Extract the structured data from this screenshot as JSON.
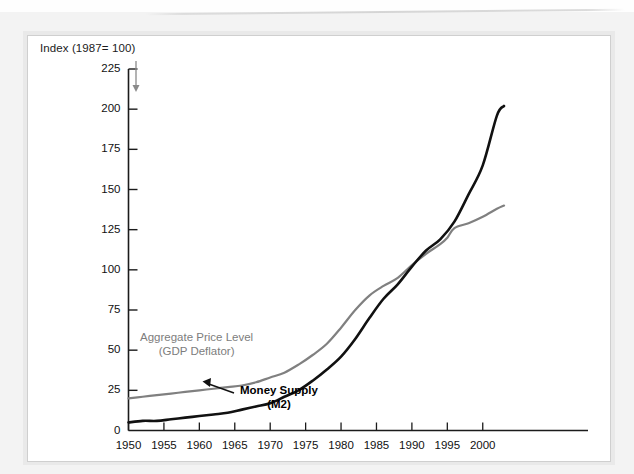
{
  "chart_data": {
    "type": "line",
    "title": "",
    "ylabel": "Index (1987= 100)",
    "xlabel": "",
    "xlim": [
      1950,
      2003
    ],
    "ylim": [
      0,
      225
    ],
    "yticks": [
      0,
      25,
      50,
      75,
      100,
      125,
      150,
      175,
      200,
      225
    ],
    "xticks": [
      1950,
      1955,
      1960,
      1965,
      1970,
      1975,
      1980,
      1985,
      1990,
      1995,
      2000
    ],
    "grid": false,
    "legend_position": "inline-annotations",
    "series": [
      {
        "name": "Aggregate Price Level (GDP Deflator)",
        "color": "#808080",
        "x": [
          1950,
          1952,
          1954,
          1956,
          1958,
          1960,
          1962,
          1964,
          1966,
          1968,
          1970,
          1972,
          1974,
          1976,
          1978,
          1980,
          1982,
          1984,
          1986,
          1988,
          1990,
          1992,
          1994,
          1995,
          1996,
          1998,
          2000,
          2002,
          2003
        ],
        "values": [
          20,
          21,
          22,
          23,
          24,
          25,
          26,
          27,
          28,
          30,
          33,
          36,
          41,
          47,
          54,
          64,
          75,
          84,
          90,
          95,
          103,
          110,
          116,
          120,
          126,
          129,
          133,
          138,
          140
        ]
      },
      {
        "name": "Money Supply (M2)",
        "color": "#111111",
        "x": [
          1950,
          1952,
          1954,
          1956,
          1958,
          1960,
          1962,
          1964,
          1966,
          1968,
          1970,
          1972,
          1974,
          1976,
          1978,
          1980,
          1982,
          1984,
          1986,
          1988,
          1990,
          1992,
          1994,
          1996,
          1998,
          2000,
          2002,
          2003
        ],
        "values": [
          5,
          6,
          6,
          7,
          8,
          9,
          10,
          11,
          13,
          15,
          17,
          21,
          25,
          31,
          38,
          46,
          57,
          70,
          82,
          91,
          102,
          112,
          119,
          130,
          147,
          165,
          196,
          202
        ]
      }
    ],
    "annotations": [
      {
        "name": "aggregate-price-level-annotation",
        "line1": "Aggregate Price Level",
        "line2": "(GDP Deflator)",
        "color": "#7d7d7d",
        "bold": false
      },
      {
        "name": "money-supply-annotation",
        "line1": "Money Supply",
        "line2": "(M2)",
        "color": "#000000",
        "bold": true
      }
    ]
  }
}
